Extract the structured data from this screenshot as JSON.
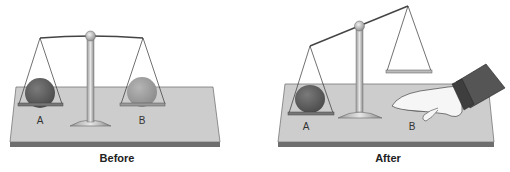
{
  "panels": [
    {
      "caption": "Before",
      "label_a": "A",
      "label_b": "B"
    },
    {
      "caption": "After",
      "label_a": "A",
      "label_b": "B"
    }
  ],
  "colors": {
    "board": "#c8c8c8",
    "board_edge": "#8a8a8a",
    "clay_a": "#6a6a6a",
    "clay_b": "#a5a5a5",
    "sleeve": "#555555",
    "hand": "#f4f4f4"
  }
}
